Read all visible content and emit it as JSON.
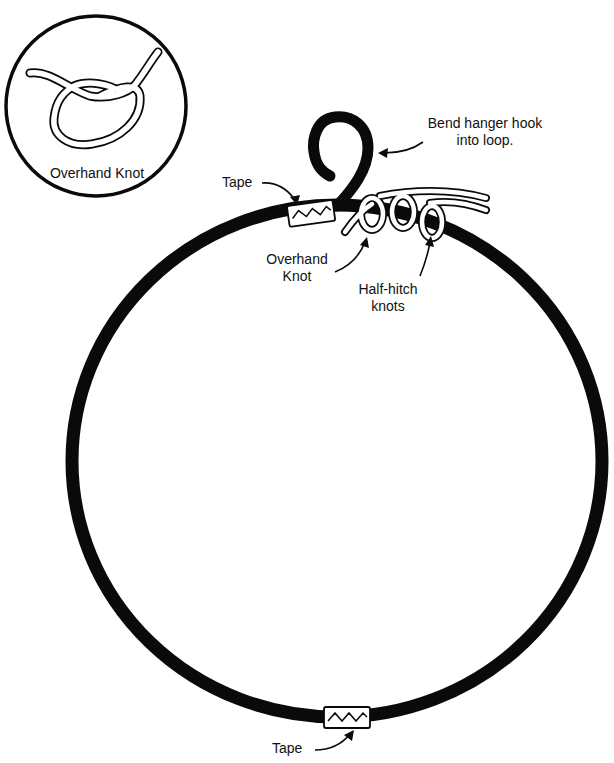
{
  "diagram": {
    "inset": {
      "label": "Overhand Knot"
    },
    "labels": {
      "bend_hook": [
        "Bend hanger hook",
        "into loop."
      ],
      "tape_top": "Tape",
      "overhand_knot": [
        "Overhand",
        "Knot"
      ],
      "half_hitch": [
        "Half-hitch",
        "knots"
      ],
      "tape_bottom": "Tape"
    },
    "colors": {
      "ink": "#0a0a0a",
      "background": "#ffffff"
    }
  }
}
